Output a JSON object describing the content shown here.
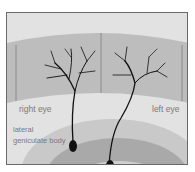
{
  "figure": {
    "labels": {
      "right_eye": "right eye",
      "left_eye": "left eye",
      "lgn_line1": "lateral",
      "lgn_line2": "geniculate body"
    },
    "colors": {
      "background": "#e2e2e2",
      "retina_band": "#bdbdbd",
      "layer_outer": "#c9c9c9",
      "layer_middle": "#a9a9a9",
      "layer_inner": "#d0d0d0",
      "neuron": "#111111"
    }
  }
}
